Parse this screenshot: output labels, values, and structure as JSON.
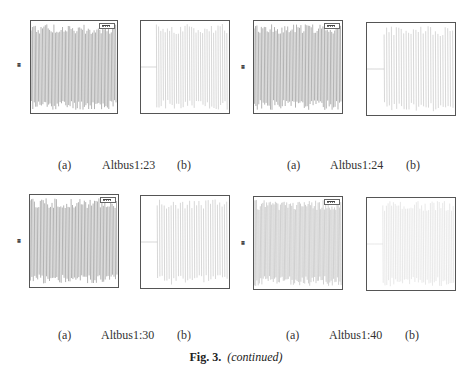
{
  "figure": {
    "number_label": "Fig. 3.",
    "note": "(continued)"
  },
  "groups": [
    {
      "name": "Altbus1:23",
      "label_a": "(a)",
      "label_b": "(b)",
      "plot_a": {
        "legend": [
          "",
          ""
        ],
        "ylabel": "",
        "xlabel": "t",
        "xticks": [
          "0",
          "10",
          "20",
          "30",
          "40",
          "50",
          "60",
          "70",
          "80",
          "90",
          "100"
        ]
      },
      "plot_b": {
        "xticks": [
          "0",
          "10",
          "20",
          "30",
          "40",
          "50",
          "60",
          "70",
          "80",
          "90",
          "100"
        ]
      }
    },
    {
      "name": "Altbus1:24",
      "label_a": "(a)",
      "label_b": "(b)",
      "plot_a": {
        "legend": [
          "",
          ""
        ],
        "ylabel": "",
        "xlabel": "t",
        "xticks": [
          "0",
          "10",
          "20",
          "30",
          "40",
          "50",
          "60",
          "70",
          "80",
          "90",
          "100"
        ]
      },
      "plot_b": {
        "xticks": [
          "0",
          "10",
          "20",
          "30",
          "40",
          "50",
          "60",
          "70",
          "80",
          "90",
          "100"
        ]
      }
    },
    {
      "name": "Altbus1:30",
      "label_a": "(a)",
      "label_b": "(b)",
      "plot_a": {
        "legend": [
          "",
          ""
        ],
        "ylabel": "",
        "xlabel": "t",
        "xticks": [
          "0",
          "10",
          "20",
          "30",
          "40",
          "50",
          "60",
          "70",
          "80",
          "90",
          "100"
        ]
      },
      "plot_b": {
        "xticks": [
          "0",
          "10",
          "20",
          "30",
          "40",
          "50",
          "60",
          "70",
          "80",
          "90",
          "100"
        ]
      }
    },
    {
      "name": "Altbus1:40",
      "label_a": "(a)",
      "label_b": "(b)",
      "plot_a": {
        "legend": [
          "",
          ""
        ],
        "ylabel": "",
        "xlabel": "t",
        "xticks": [
          "0",
          "10",
          "20",
          "30",
          "40",
          "50",
          "60",
          "70",
          "80",
          "90",
          "100"
        ]
      },
      "plot_b": {
        "xticks": [
          "0",
          "10",
          "20",
          "30",
          "40",
          "50",
          "60",
          "70",
          "80",
          "90",
          "100"
        ]
      }
    }
  ]
}
